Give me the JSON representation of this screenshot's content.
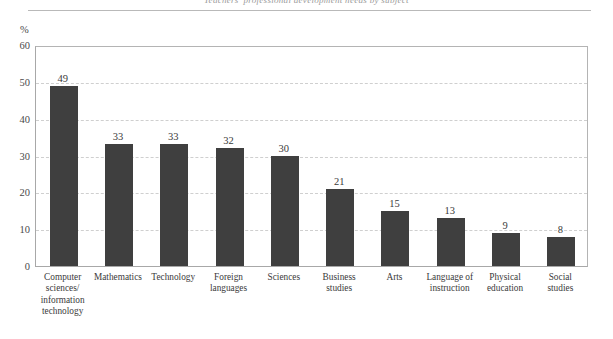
{
  "figure": {
    "running_head": "Teachers' professional development needs by subject",
    "unit_label": "%"
  },
  "chart_data": {
    "type": "bar",
    "title": "",
    "xlabel": "",
    "ylabel": "%",
    "ylim": [
      0,
      60
    ],
    "yticks": [
      0,
      10,
      20,
      30,
      40,
      50,
      60
    ],
    "grid": true,
    "legend": "none",
    "bar_color": "#3f3f3f",
    "categories": [
      "Computer sciences/ information technology",
      "Mathematics",
      "Technology",
      "Foreign languages",
      "Sciences",
      "Business studies",
      "Arts",
      "Language of instruction",
      "Physical education",
      "Social studies"
    ],
    "category_lines": [
      [
        "Computer",
        "sciences/",
        "information",
        "technology"
      ],
      [
        "Mathematics"
      ],
      [
        "Technology"
      ],
      [
        "Foreign",
        "languages"
      ],
      [
        "Sciences"
      ],
      [
        "Business",
        "studies"
      ],
      [
        "Arts"
      ],
      [
        "Language of",
        "instruction"
      ],
      [
        "Physical",
        "education"
      ],
      [
        "Social",
        "studies"
      ]
    ],
    "values": [
      49,
      33,
      33,
      32,
      30,
      21,
      15,
      13,
      9,
      8
    ],
    "value_labels": [
      "49",
      "33",
      "33",
      "32",
      "30",
      "21",
      "15",
      "13",
      "9",
      "8"
    ]
  }
}
